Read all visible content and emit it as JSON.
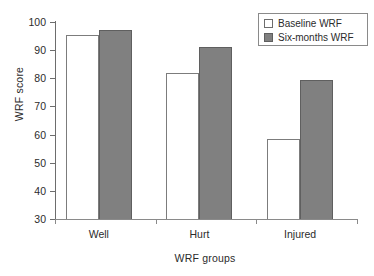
{
  "chart_data": {
    "type": "bar",
    "title": "",
    "xlabel": "WRF groups",
    "ylabel": "WRF score",
    "categories": [
      "Well",
      "Hurt",
      "Injured"
    ],
    "series": [
      {
        "name": "Baseline WRF",
        "values": [
          95.5,
          82,
          58.5
        ],
        "color": "#ffffff"
      },
      {
        "name": "Six-months WRF",
        "values": [
          97,
          91,
          79.5
        ],
        "color": "#808080"
      }
    ],
    "ylim": [
      30,
      100
    ],
    "yticks": [
      30,
      40,
      50,
      60,
      70,
      80,
      90,
      100
    ],
    "ytick_labels": [
      "30",
      "40",
      "50",
      "60",
      "70",
      "80",
      "90",
      "100"
    ],
    "grid": false,
    "legend_position": "top-right"
  },
  "legend": {
    "entries": [
      {
        "label": "Baseline WRF",
        "swatch": "white-square-icon"
      },
      {
        "label": "Six-months WRF",
        "swatch": "gray-square-icon"
      }
    ]
  }
}
